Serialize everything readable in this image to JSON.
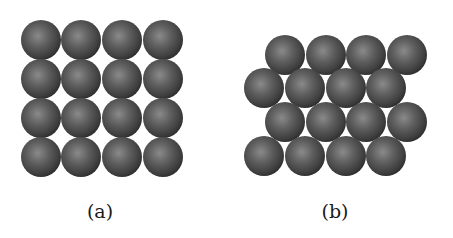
{
  "figure": {
    "panels": [
      {
        "label": "(a)",
        "arrangement": "square packing",
        "rows": 4,
        "cols": 4,
        "sphere_count": 16,
        "label_x": 100,
        "label_y": 200,
        "spheres": [
          [
            41,
            40
          ],
          [
            81,
            40
          ],
          [
            122,
            40
          ],
          [
            163,
            40
          ],
          [
            41,
            79
          ],
          [
            81,
            79
          ],
          [
            122,
            79
          ],
          [
            163,
            79
          ],
          [
            41,
            118
          ],
          [
            81,
            118
          ],
          [
            122,
            118
          ],
          [
            163,
            118
          ],
          [
            41,
            157
          ],
          [
            81,
            157
          ],
          [
            122,
            157
          ],
          [
            163,
            157
          ]
        ]
      },
      {
        "label": "(b)",
        "arrangement": "hexagonal (close) packing",
        "rows": 4,
        "cols": 4,
        "sphere_count": 16,
        "label_x": 335,
        "label_y": 200,
        "spheres": [
          [
            285,
            55
          ],
          [
            326,
            55
          ],
          [
            366,
            55
          ],
          [
            407,
            55
          ],
          [
            264,
            88
          ],
          [
            305,
            88
          ],
          [
            346,
            88
          ],
          [
            386,
            88
          ],
          [
            285,
            122
          ],
          [
            326,
            122
          ],
          [
            366,
            122
          ],
          [
            407,
            122
          ],
          [
            264,
            156
          ],
          [
            305,
            156
          ],
          [
            346,
            156
          ],
          [
            386,
            156
          ]
        ]
      }
    ],
    "sphere_radius": 20,
    "colors": {
      "sphere_highlight": "#8a8a8a",
      "sphere_mid": "#5c5c5c",
      "sphere_edge": "#2e2e2e",
      "background": "#ffffff",
      "label_text": "#1a1a1a"
    }
  }
}
